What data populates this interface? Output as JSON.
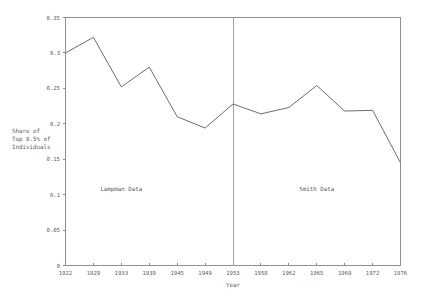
{
  "chart_data": {
    "type": "line",
    "title": "",
    "xlabel": "Year",
    "ylabel": "Share of Top 0.5% of Individuals",
    "ylabel_lines": [
      "Share of",
      "Top 0.5% of",
      "Individuals"
    ],
    "categories": [
      "1922",
      "1929",
      "1933",
      "1939",
      "1945",
      "1949",
      "1953",
      "1958",
      "1962",
      "1965",
      "1969",
      "1972",
      "1976"
    ],
    "values": [
      0.3,
      0.322,
      0.252,
      0.28,
      0.21,
      0.194,
      0.228,
      0.214,
      0.223,
      0.254,
      0.218,
      0.219,
      0.145
    ],
    "ylim": [
      0,
      0.35
    ],
    "yticks": [
      0,
      0.05,
      0.1,
      0.15,
      0.2,
      0.25,
      0.3,
      0.35
    ],
    "ytick_labels": [
      "0",
      "0.05",
      "0.1",
      "0.15",
      "0.2",
      "0.25",
      "0.3",
      "0.35"
    ],
    "grid": false,
    "legend": "none",
    "annotations": [
      {
        "text": "Lampman Data",
        "x_category": "1933",
        "y_value": 0.105
      },
      {
        "text": "Smith Data",
        "x_category": "1965",
        "y_value": 0.105
      }
    ],
    "divider": {
      "x_category": "1953",
      "label": ""
    },
    "colors": {
      "series_line": "#6b6e73",
      "axis": "#8d9095",
      "divider": "#a0a3a8",
      "text": "#5a5d61",
      "background": "#ffffff"
    }
  }
}
